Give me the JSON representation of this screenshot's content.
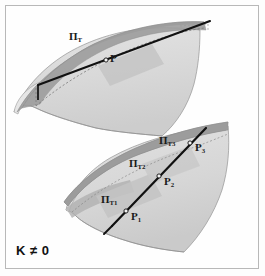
{
  "figure": {
    "caption": "K ≠ 0",
    "background_color": "#fdfdfd",
    "frame_color": "#b8b8b8"
  },
  "colors": {
    "surface_light": "#dcdcdc",
    "surface_mid": "#cfcfcf",
    "surface_dark": "#bdbdbd",
    "plane_dark": "#9e9e9e",
    "plane_mid": "#b4b4b4",
    "outline": "#8a8a8a",
    "line_black": "#111111",
    "label_color": "#1a1a1a"
  },
  "upper_surface": {
    "name": "saddle-surface-upper",
    "tangent_plane_label": "Π",
    "tangent_plane_sub": "T",
    "point_label": "P",
    "point_sub": ""
  },
  "lower_surface": {
    "name": "saddle-surface-lower",
    "planes": [
      {
        "label": "Π",
        "sub": "T1"
      },
      {
        "label": "Π",
        "sub": "T2"
      },
      {
        "label": "Π",
        "sub": "T3"
      }
    ],
    "points": [
      {
        "label": "P",
        "sub": "1"
      },
      {
        "label": "P",
        "sub": "2"
      },
      {
        "label": "P",
        "sub": "3"
      }
    ]
  },
  "labels": {
    "pi_T": "Π",
    "pi_T_sub": "T",
    "P": "P",
    "pi_T1": "Π",
    "pi_T1_sub": "T1",
    "pi_T2": "Π",
    "pi_T2_sub": "T2",
    "pi_T3": "Π",
    "pi_T3_sub": "T3",
    "P1": "P",
    "P1_sub": "1",
    "P2": "P",
    "P2_sub": "2",
    "P3": "P",
    "P3_sub": "3"
  }
}
